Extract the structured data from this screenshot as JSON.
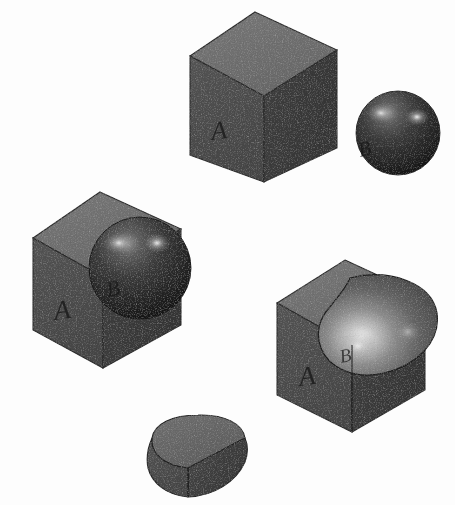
{
  "figure": {
    "background_color": "#fdfdfd",
    "width": 455,
    "height": 505,
    "render_style": "grainy halftone grayscale raster scan"
  },
  "palette": {
    "cube_top_face": "#6e6e6e",
    "cube_left_face": "#4d4d4d",
    "cube_right_face": "#3c3c3c",
    "cube_edge": "#262626",
    "sphere_base": "#3a3a3a",
    "sphere_dark": "#1d1d1d",
    "sphere_highlight": "#c9c9c9",
    "cavity_base": "#585858",
    "cavity_highlight": "#e2e2e2",
    "outline": "#1a1a1a",
    "label_color": "#1d1d1d"
  },
  "objects": [
    {
      "id": "primitive-cube",
      "name": "Cube primitive A",
      "operation": "primitive",
      "label": "A",
      "position": "top-center",
      "center": [
        264,
        97
      ],
      "description": "Solid isometric cube, three visible faces, letter A etched on the front-left face"
    },
    {
      "id": "primitive-sphere",
      "name": "Sphere primitive B",
      "operation": "primitive",
      "label": "B",
      "position": "top-right",
      "center": [
        398,
        133
      ],
      "radius": 42,
      "description": "Shaded sphere with two specular highlights, letter B etched on the lower-left"
    },
    {
      "id": "union-result",
      "name": "Union of cube and sphere",
      "operation": "union",
      "expression": "A ∪ B",
      "label_primary": "A",
      "label_secondary": "B",
      "position": "middle-left",
      "center": [
        120,
        280
      ],
      "description": "Cube with sphere merged into its upper-right corner; both surfaces retained"
    },
    {
      "id": "difference-result",
      "name": "Cube with spherical cavity",
      "operation": "difference",
      "expression": "A − B",
      "label_primary": "A",
      "label_secondary": "B",
      "position": "middle-right",
      "center": [
        360,
        350
      ],
      "description": "Cube with a spherical pocket subtracted from the top-right corner, concave highlight inside"
    },
    {
      "id": "intersection-result",
      "name": "Intersection of cube and sphere",
      "operation": "intersection",
      "expression": "A ∩ B",
      "position": "bottom-center",
      "center": [
        198,
        453
      ],
      "description": "Spherical octant wedge, the solid common to both cube and sphere"
    }
  ],
  "labels": {
    "cube_a": "A",
    "sphere_b": "B",
    "union_a": "A",
    "union_b": "B",
    "difference_a": "A",
    "difference_b": "B"
  }
}
